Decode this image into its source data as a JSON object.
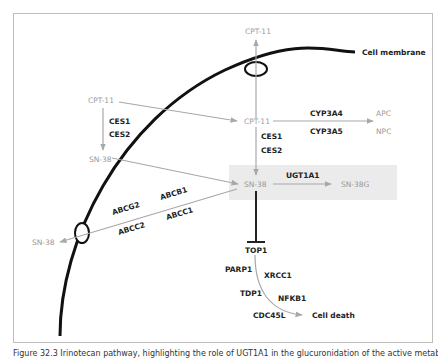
{
  "diagram": {
    "membrane_label": "Cell membrane",
    "nodes": {
      "cpt11_top": "CPT-11",
      "cpt11_outside": "CPT-11",
      "sn38_outside": "SN-38",
      "cpt11_inside": "CPT-11",
      "apc": "APC",
      "npc": "NPC",
      "sn38_inside": "SN-38",
      "sn38g": "SN-38G",
      "sn38_efflux": "SN-38",
      "top1": "TOP1",
      "cell_death": "Cell death"
    },
    "enzymes": {
      "ces1_outside": "CES1",
      "ces2_outside": "CES2",
      "ces1_inside": "CES1",
      "ces2_inside": "CES2",
      "cyp3a4": "CYP3A4",
      "cyp3a5": "CYP3A5",
      "ugt1a1": "UGT1A1",
      "abcb1": "ABCB1",
      "abcg2": "ABCG2",
      "abcc1": "ABCC1",
      "abcc2": "ABCC2",
      "parp1": "PARP1",
      "xrcc1": "XRCC1",
      "tdp1": "TDP1",
      "nfkb1": "NFKB1",
      "cdc45l": "CDC45L"
    },
    "colors": {
      "membrane": "#111111",
      "arrow": "#a8a8a8",
      "highlight_box": "#ebebeb",
      "inhibition": "#222222"
    }
  },
  "caption": "Figure 32.3 Irinotecan pathway, highlighting the role of UGT1A1 in the glucuronidation of the active metabolite"
}
